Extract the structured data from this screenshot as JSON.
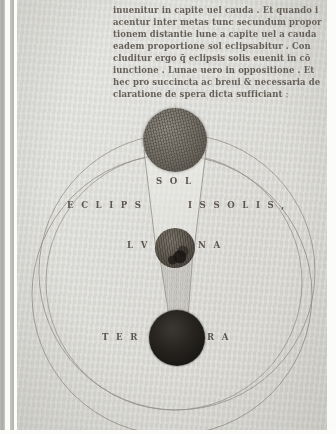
{
  "document": {
    "kind": "illuminated-manuscript-leaf",
    "script": "gothic-textualis",
    "language": "Latin",
    "ink_color": "#4a433b",
    "parchment_color": "#dcdcd8"
  },
  "text_block": {
    "lines": [
      "inuenitur in capite uel cauda . Et quando i",
      "acentur inter metas tunc secundum propor",
      "tionem distantie lune a capite uel a cauda",
      "eadem proportione sol eclipsabitur . Con",
      "cluditur ergo q̄ eclipsis solis euenit in cō",
      "iunctione . Lunae uero in oppositione . Et",
      "hec pro succincta ac breui & necessaria de",
      "claratione de spera dicta sufficiant ː"
    ]
  },
  "diagram": {
    "labels": {
      "sun": "S O L",
      "eclipse_left": "E C L I P S",
      "eclipse_right": "I S   S O L I S ,",
      "moon_left": "L V",
      "moon_right": "N A",
      "earth_left": "T E R",
      "earth_right": "R A"
    },
    "bodies": [
      {
        "name": "sol",
        "label": "SOL",
        "fill": "#6e695f",
        "radius_px": 32
      },
      {
        "name": "luna",
        "label": "LVNA",
        "fill": "#5d584f",
        "radius_px": 20
      },
      {
        "name": "terra",
        "label": "TERRA",
        "fill": "#1d1a17",
        "radius_px": 28
      }
    ],
    "circles": [
      {
        "name": "sphere-of-the-sun",
        "cx": 155,
        "cy": 295,
        "r": 140
      },
      {
        "name": "sphere-of-the-moon-outer",
        "cx": 160,
        "cy": 272,
        "r": 138
      },
      {
        "name": "sphere-of-the-moon-inner",
        "cx": 157,
        "cy": 282,
        "r": 128
      }
    ],
    "cones": [
      {
        "name": "light-cone-sun-to-moon",
        "from": "sol",
        "to": "luna"
      },
      {
        "name": "umbra-cone-moon-to-earth",
        "from": "luna",
        "to": "terra"
      }
    ],
    "line_color": "#6b655b"
  }
}
